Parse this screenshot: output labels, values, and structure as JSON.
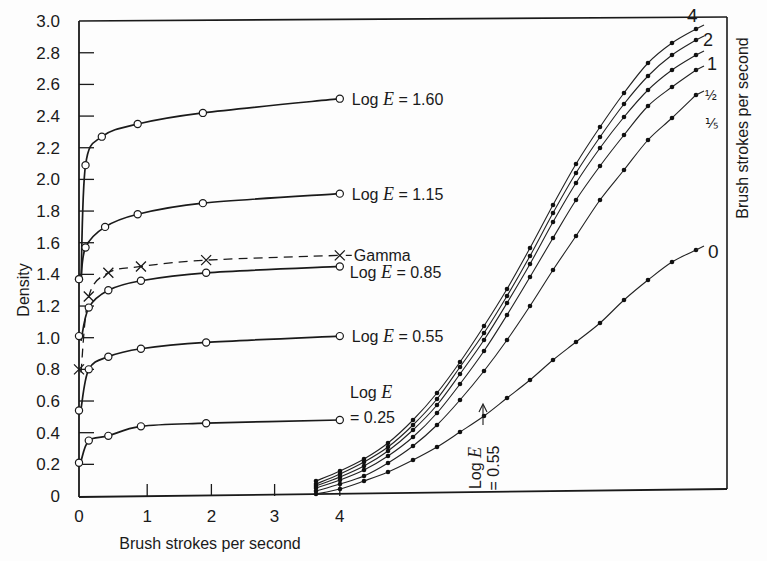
{
  "chart_data": {
    "type": "line",
    "title": "",
    "xlabel": "Brush strokes per second",
    "ylabel": "Density",
    "right_label": "Brush strokes per second",
    "ylim": [
      0,
      3.0
    ],
    "xlim": [
      0,
      4
    ],
    "y_ticks": [
      "0",
      "0.2",
      "0.4",
      "0.6",
      "0.8",
      "1.0",
      "1.2",
      "1.4",
      "1.6",
      "1.8",
      "2.0",
      "2.2",
      "2.4",
      "2.6",
      "2.8",
      "3.0"
    ],
    "x_ticks": [
      "0",
      "1",
      "2",
      "3",
      "4"
    ],
    "grid": false,
    "left_panel": {
      "description": "Density vs brush strokes per second at constant exposure",
      "series": [
        {
          "name": "Log E = 1.60",
          "label_prefix": "Log ",
          "label_var": "E",
          "label_value": " = 1.60",
          "marker": "open-circle",
          "x": [
            0,
            0.1,
            0.35,
            0.9,
            1.9,
            4.0
          ],
          "y": [
            1.37,
            2.09,
            2.27,
            2.35,
            2.42,
            2.51
          ]
        },
        {
          "name": "Log E = 1.15",
          "label_prefix": "Log ",
          "label_var": "E",
          "label_value": " = 1.15",
          "marker": "open-circle",
          "x": [
            0,
            0.1,
            0.4,
            0.9,
            1.9,
            4.0
          ],
          "y": [
            1.37,
            1.57,
            1.7,
            1.78,
            1.85,
            1.91
          ]
        },
        {
          "name": "Gamma",
          "label_prefix": "",
          "label_var": "",
          "label_value": "Gamma",
          "marker": "x",
          "style": "dashed",
          "x": [
            0,
            0.15,
            0.45,
            0.95,
            1.95,
            4.0
          ],
          "y": [
            0.8,
            1.26,
            1.41,
            1.45,
            1.49,
            1.52
          ]
        },
        {
          "name": "Log E = 0.85",
          "label_prefix": "Log ",
          "label_var": "E",
          "label_value": " = 0.85",
          "marker": "open-circle",
          "x": [
            0,
            0.15,
            0.45,
            0.95,
            1.95,
            4.0
          ],
          "y": [
            1.01,
            1.19,
            1.3,
            1.36,
            1.41,
            1.45
          ]
        },
        {
          "name": "Log E = 0.55",
          "label_prefix": "Log ",
          "label_var": "E",
          "label_value": " = 0.55",
          "marker": "open-circle",
          "x": [
            0,
            0.15,
            0.45,
            0.95,
            1.95,
            4.0
          ],
          "y": [
            0.54,
            0.8,
            0.88,
            0.93,
            0.97,
            1.01
          ]
        },
        {
          "name": "Log E = 0.25",
          "label_prefix": "Log ",
          "label_var": "E",
          "label_line2": "= 0.25",
          "marker": "open-circle",
          "x": [
            0,
            0.15,
            0.45,
            0.95,
            1.95,
            4.0
          ],
          "y": [
            0.21,
            0.35,
            0.38,
            0.44,
            0.46,
            0.48
          ]
        }
      ]
    },
    "right_panel": {
      "description": "Characteristic curves (Density vs Log E) for brush rates; x-axis unlabeled, offset starting near x=3.6",
      "series_labels": [
        "4",
        "2",
        "1",
        "½",
        "⅕",
        "0"
      ],
      "annotation": {
        "line1_prefix": "Log ",
        "line1_var": "E",
        "line2": "= 0.55"
      },
      "series": [
        {
          "name": "4",
          "y_end": 2.85
        },
        {
          "name": "2",
          "y_end": 2.78
        },
        {
          "name": "1",
          "y_end": 2.7
        },
        {
          "name": "1/2",
          "y_end": 2.6
        },
        {
          "name": "1/5",
          "y_end": 2.42
        },
        {
          "name": "0",
          "y_end": 1.57
        }
      ]
    }
  }
}
